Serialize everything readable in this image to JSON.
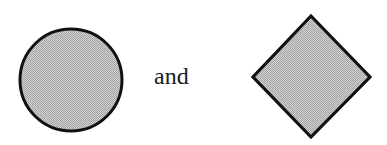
{
  "figure": {
    "conjunction": "and",
    "shapes": [
      {
        "kind": "circle",
        "label": "shaded-circle",
        "cx": 71,
        "cy": 80,
        "r": 51
      },
      {
        "kind": "diamond",
        "label": "shaded-diamond",
        "points": "311,16 370,77 311,137 253,77"
      }
    ],
    "colors": {
      "stroke": "#111111",
      "fill_light": "#d9d9d9",
      "fill_dark": "#9a9a9a",
      "text": "#1a1a1a"
    }
  }
}
